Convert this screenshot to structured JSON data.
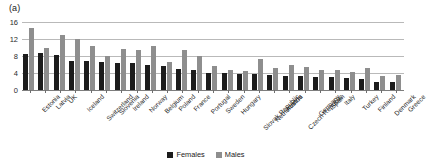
{
  "panel": {
    "label": "(a)"
  },
  "legend": {
    "position": "bottom-center",
    "items": [
      {
        "label": "Females",
        "color": "#1c1c1c",
        "swatch": "square-swatch"
      },
      {
        "label": "Males",
        "color": "#8e8e8e",
        "swatch": "square-swatch"
      }
    ]
  },
  "axis": {
    "yticks": [
      "0",
      "4",
      "8",
      "12",
      "16"
    ]
  },
  "chart_data": {
    "type": "bar",
    "title": "",
    "subtitle": "",
    "xlabel": "",
    "ylabel": "",
    "ylim": [
      0,
      16
    ],
    "yticks": [
      0,
      4,
      8,
      12,
      16
    ],
    "grid": true,
    "legend_position": "bottom-center",
    "annotations": [
      "(a)"
    ],
    "categories": [
      "Estonia",
      "Latvia",
      "UK",
      "Iceland",
      "Switzerland",
      "Slovenia",
      "Ireland",
      "Norway",
      "Belgium",
      "Poland",
      "France",
      "Portugal",
      "Sweden",
      "Hungary",
      "Slovak Republic",
      "Netherlands",
      "Austria",
      "Czech Republic",
      "Germany",
      "Spain",
      "Italy",
      "Turkey",
      "Finland",
      "Denmark",
      "Greece"
    ],
    "series": [
      {
        "name": "Females",
        "color": "#1c1c1c",
        "values": [
          8.5,
          8.6,
          8.3,
          6.8,
          6.8,
          6.5,
          6.4,
          6.3,
          5.9,
          5.7,
          4.9,
          4.8,
          4.1,
          3.9,
          3.8,
          3.7,
          3.6,
          3.4,
          3.3,
          3.1,
          3.0,
          2.9,
          2.6,
          1.9,
          1.9
        ]
      },
      {
        "name": "Males",
        "color": "#8e8e8e",
        "values": [
          14.6,
          10.0,
          13.0,
          11.9,
          10.3,
          8.0,
          9.6,
          9.3,
          10.3,
          6.6,
          9.4,
          8.0,
          5.6,
          4.6,
          4.5,
          7.2,
          5.1,
          6.0,
          5.5,
          4.6,
          4.7,
          4.3,
          5.2,
          3.2,
          3.5
        ]
      }
    ]
  }
}
